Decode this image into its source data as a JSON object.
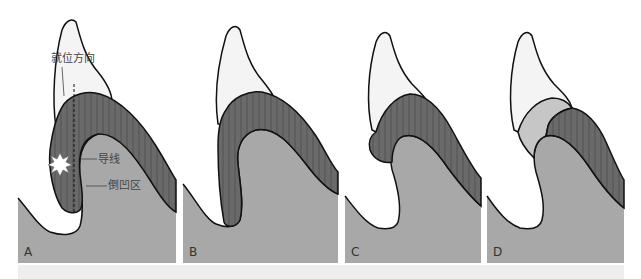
{
  "figure": {
    "colors": {
      "gingiva": "#a8a8a8",
      "crown_band": "#6a6a6a",
      "crown_band_light": "#c6c6c6",
      "tooth": "#f4f4f4",
      "outline": "#111111",
      "strip": "#eeeeee"
    },
    "panels": [
      {
        "id": "A",
        "label": "A"
      },
      {
        "id": "B",
        "label": "B"
      },
      {
        "id": "C",
        "label": "C"
      },
      {
        "id": "D",
        "label": "D"
      }
    ],
    "annotations": {
      "path_direction": "就位方向",
      "guide_line": "导线",
      "undercut_area": "倒凹区"
    }
  }
}
